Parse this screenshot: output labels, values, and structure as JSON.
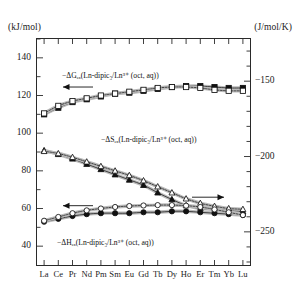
{
  "axes": {
    "left_unit": "(kJ/mol)",
    "right_unit": "(J/mol/K)",
    "left_ticks": [
      "140",
      "120",
      "100",
      "80",
      "60",
      "40"
    ],
    "right_ticks": [
      "−150",
      "−200",
      "−250"
    ],
    "x_ticks": [
      "La",
      "Ce",
      "Pr",
      "Nd",
      "Pm",
      "Sm",
      "Eu",
      "Gd",
      "Tb",
      "Dy",
      "Ho",
      "Er",
      "Tm",
      "Yb",
      "Lu"
    ]
  },
  "annotations": {
    "gibbs": "−ΔGₑₓ(Ln-dipic₃/Ln³⁺ (oct, aq))",
    "entropy": "−ΔSₑₓ(Ln-dipic₃/Ln³⁺ (oct, aq))",
    "enthalpy": "−ΔHₑₓ(Ln-dipic₃/Ln³⁺ (oct, aq))",
    "arrow_left": "←",
    "arrow_right": "→"
  },
  "chart_data": {
    "type": "line",
    "title": "",
    "xlabel": "",
    "ylabel": "(kJ/mol)",
    "y2label": "(J/mol/K)",
    "grid": false,
    "legend": "none",
    "categories": [
      "La",
      "Ce",
      "Pr",
      "Nd",
      "Pm",
      "Sm",
      "Eu",
      "Gd",
      "Tb",
      "Dy",
      "Ho",
      "Er",
      "Tm",
      "Yb",
      "Lu"
    ],
    "ylim": [
      30,
      150
    ],
    "y2lim": [
      -272,
      -122
    ],
    "series": [
      {
        "name": "−ΔG_ex filled",
        "marker": "filled-square",
        "axis": "left",
        "values": [
          110.0,
          113.5,
          116.5,
          118.0,
          119.5,
          121.0,
          121.5,
          122.5,
          123.5,
          124.5,
          125.0,
          125.0,
          124.5,
          124.0,
          124.0
        ]
      },
      {
        "name": "−ΔG_ex open",
        "marker": "open-square",
        "axis": "left",
        "values": [
          110.5,
          114.5,
          117.0,
          118.5,
          120.0,
          121.0,
          122.0,
          123.0,
          124.0,
          124.5,
          124.5,
          124.0,
          123.0,
          122.5,
          122.5
        ]
      },
      {
        "name": "−ΔS_ex filled",
        "marker": "filled-triangle",
        "axis": "right",
        "values": [
          -196.0,
          -198.5,
          -201.5,
          -205.0,
          -208.5,
          -212.0,
          -215.5,
          -219.0,
          -224.0,
          -228.5,
          -232.5,
          -234.5,
          -235.0,
          -235.5,
          -236.5
        ]
      },
      {
        "name": "−ΔS_ex open",
        "marker": "open-triangle",
        "axis": "right",
        "values": [
          -196.5,
          -198.0,
          -200.5,
          -203.5,
          -206.5,
          -209.5,
          -212.5,
          -216.0,
          -220.0,
          -224.0,
          -228.0,
          -231.0,
          -233.0,
          -234.5,
          -235.0
        ]
      },
      {
        "name": "−ΔH_ex filled",
        "marker": "filled-circle",
        "axis": "left",
        "values": [
          53.0,
          54.5,
          56.0,
          57.0,
          57.5,
          57.5,
          57.5,
          58.0,
          58.0,
          58.5,
          58.5,
          58.0,
          57.5,
          57.0,
          56.5
        ]
      },
      {
        "name": "−ΔH_ex open",
        "marker": "open-circle",
        "axis": "left",
        "values": [
          53.5,
          55.5,
          57.5,
          59.0,
          60.0,
          60.8,
          61.3,
          61.6,
          61.8,
          61.8,
          61.5,
          60.8,
          59.5,
          58.0,
          56.5
        ]
      }
    ]
  }
}
